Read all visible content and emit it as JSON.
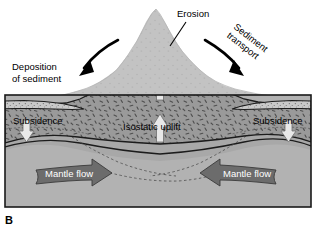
{
  "figure": {
    "panel_letter": "B"
  },
  "labels": {
    "erosion": "Erosion",
    "sediment_transport_line1": "Sediment",
    "sediment_transport_line2": "transport",
    "deposition_line1": "Deposition",
    "deposition_line2": "of sediment",
    "subsidence_left": "Subsidence",
    "subsidence_right": "Subsidence",
    "isostatic_uplift": "Isostatic uplift",
    "mantle_flow_left": "Mantle flow",
    "mantle_flow_right": "Mantle flow"
  },
  "colors": {
    "background": "#ffffff",
    "frame_border": "#1a1a1a",
    "mantle_fill": "#b0b0b0",
    "crust_fill": "#9a9a9a",
    "eroded_mountain_fill": "#c4c4c4",
    "sediment_fill": "#c9c9c9",
    "mantle_flow_arrow_fill": "#6a6a6a",
    "uplift_arrow_fill": "#e2e2e2",
    "transport_arrow_fill": "#000000",
    "stipple": "#5a5a5a",
    "dashed_line": "#4a4a4a",
    "label_text": "#000000",
    "label_text_inverse": "#ffffff"
  },
  "geometry": {
    "frame": {
      "x": 5,
      "y": 95,
      "width": 306,
      "height": 112
    },
    "sediment_transport_rotation_deg": 38
  }
}
